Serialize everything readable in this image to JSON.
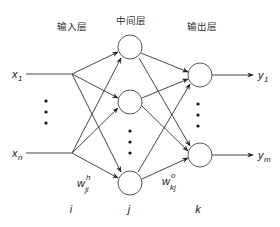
{
  "diagram": {
    "type": "neural-network",
    "layers": [
      {
        "label": "输入层",
        "index_label": "i"
      },
      {
        "label": "中间层",
        "index_label": "j"
      },
      {
        "label": "输出层",
        "index_label": "k"
      }
    ],
    "inputs": [
      {
        "symbol": "x",
        "subscript": "1"
      },
      {
        "symbol": "x",
        "subscript": "n"
      }
    ],
    "outputs": [
      {
        "symbol": "y",
        "subscript": "1"
      },
      {
        "symbol": "y",
        "subscript": "m"
      }
    ],
    "weights": {
      "hidden": {
        "symbol": "w",
        "subscript": "ji",
        "superscript": "h"
      },
      "output": {
        "symbol": "w",
        "subscript": "kj",
        "superscript": "o"
      }
    },
    "colors": {
      "stroke": "#333333",
      "background": "#ffffff"
    }
  }
}
